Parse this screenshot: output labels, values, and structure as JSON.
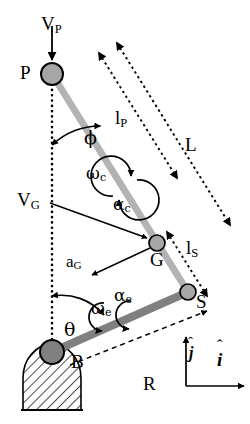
{
  "figure": {
    "background_color": "#ffffff",
    "stroke_color": "#000000",
    "link_upper_color": "#b3b3b3",
    "link_lower_color": "#808080",
    "joint_fill_color": "#a6a6a6",
    "width": 250,
    "height": 424
  },
  "joints": [
    {
      "id": "P",
      "label": "P",
      "cx": 52,
      "cy": 74,
      "r": 11
    },
    {
      "id": "G",
      "label": "G",
      "cx": 157,
      "cy": 243,
      "r": 8
    },
    {
      "id": "S",
      "label": "S",
      "cx": 188,
      "cy": 292,
      "r": 8
    },
    {
      "id": "B",
      "label": "B",
      "cx": 52,
      "cy": 352,
      "r": 12
    }
  ],
  "labels": {
    "P": "P",
    "G": "G",
    "S": "S",
    "B": "B",
    "L": "L",
    "R": "R",
    "V_P_main": "V",
    "V_P_sub": "P",
    "V_G_main": "V",
    "V_G_sub": "G",
    "a_G_main": "a",
    "a_G_sub": "G",
    "l_P_main": "l",
    "l_P_sub": "P",
    "l_S_main": "l",
    "l_S_sub": "S",
    "phi": "ϕ",
    "theta": "θ",
    "omega_c_main": "ω",
    "omega_c_sub": "c",
    "alpha_c_main": "α",
    "alpha_c_sub": "c",
    "omega_e_main": "ω",
    "omega_e_sub": "e",
    "alpha_e_main": "α",
    "alpha_e_sub": "e",
    "i_hat": "i",
    "j_hat": "j",
    "i_hat_accent": "ˆ",
    "j_hat_accent": "ˆ"
  },
  "annotations": {
    "vectors": [
      {
        "name": "V_P",
        "from": "above-P",
        "to": "P",
        "style": "solid-arrow",
        "description": "velocity of point P, pointing down"
      },
      {
        "name": "V_G",
        "from": "label",
        "to": "G",
        "style": "solid-arrow",
        "description": "velocity of center of mass G"
      },
      {
        "name": "a_G",
        "from": "G",
        "to": "lower-left",
        "style": "solid-arrow",
        "description": "acceleration of center of mass G"
      }
    ],
    "dimensions": [
      {
        "name": "l_P",
        "style": "dotted-double-arrow",
        "description": "distance from P to G along upper link"
      },
      {
        "name": "l_S",
        "style": "dotted-double-arrow",
        "description": "distance from G to S along upper link"
      },
      {
        "name": "L",
        "style": "dotted-double-arrow",
        "description": "total length from P to S"
      },
      {
        "name": "R",
        "style": "dashed-arrow",
        "description": "horizontal/ground reference from B to S"
      }
    ],
    "angles": [
      {
        "name": "phi",
        "vertex": "P",
        "between": "vertical-dotted-line and link P-S"
      },
      {
        "name": "theta",
        "vertex": "B",
        "between": "vertical-dotted-line and link B-S"
      }
    ],
    "rotations": [
      {
        "name": "omega_c",
        "description": "angular velocity of upper link (counter-clockwise curved arrow)"
      },
      {
        "name": "alpha_c",
        "description": "angular acceleration of upper link (curved arrow)"
      },
      {
        "name": "omega_e",
        "description": "angular velocity of lower link (curved arrow)"
      },
      {
        "name": "alpha_e",
        "description": "angular acceleration of lower link (curved arrow)"
      }
    ],
    "frame": {
      "name": "unit-vector-frame",
      "i_description": "unit vector i-hat pointing right",
      "j_description": "unit vector j-hat pointing up"
    },
    "ground": {
      "name": "fixed-support",
      "description": "hatched semicircular pivot support below joint B"
    }
  }
}
